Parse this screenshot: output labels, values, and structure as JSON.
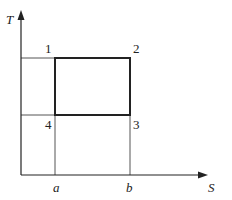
{
  "diagram": {
    "type": "T-S diagram (Carnot cycle)",
    "axes": {
      "y_label": "T",
      "x_label": "S",
      "x_ticks": [
        "a",
        "b"
      ]
    },
    "points": [
      {
        "id": "1",
        "label": "1"
      },
      {
        "id": "2",
        "label": "2"
      },
      {
        "id": "3",
        "label": "3"
      },
      {
        "id": "4",
        "label": "4"
      }
    ],
    "colors": {
      "line": "#222222",
      "thin_line": "#555555",
      "background": "#ffffff"
    }
  }
}
